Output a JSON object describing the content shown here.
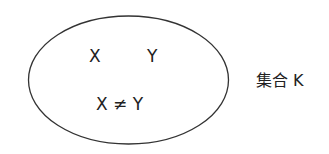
{
  "diagram": {
    "type": "set-ellipse",
    "set": {
      "name": "集合 K",
      "elements": [
        "X",
        "Y"
      ],
      "condition": "X ≠ Y"
    },
    "colors": {
      "stroke": "#333333",
      "text": "#222222",
      "background": "#ffffff"
    }
  }
}
